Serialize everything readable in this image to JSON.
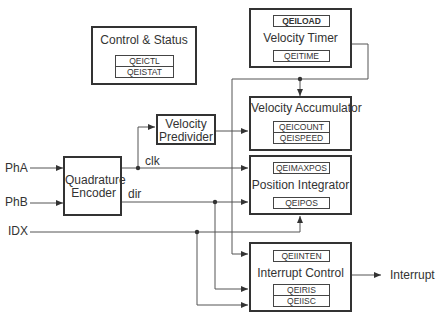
{
  "diagram": {
    "blocks": {
      "control_status": {
        "title": "Control & Status",
        "registers": [
          "QEICTL",
          "QEISTAT"
        ]
      },
      "velocity_timer": {
        "title": "Velocity Timer",
        "registers": [
          "QEILOAD",
          "QEITIME"
        ]
      },
      "velocity_predivider": {
        "title_line1": "Velocity",
        "title_line2": "Predivider"
      },
      "velocity_accumulator": {
        "title": "Velocity Accumulator",
        "registers": [
          "QEICOUNT",
          "QEISPEED"
        ]
      },
      "quadrature_encoder": {
        "title_line1": "Quadrature",
        "title_line2": "Encoder"
      },
      "position_integrator": {
        "title": "Position Integrator",
        "registers": [
          "QEIMAXPOS",
          "QEIPOS"
        ]
      },
      "interrupt_control": {
        "title": "Interrupt Control",
        "registers": [
          "QEIINTEN",
          "QEIRIS",
          "QEIISC"
        ]
      }
    },
    "inputs": [
      "PhA",
      "PhB",
      "IDX"
    ],
    "signals": {
      "clk": "clk",
      "dir": "dir"
    },
    "outputs": [
      "Interrupt"
    ],
    "colors": {
      "line": "#444444",
      "text": "#333333",
      "background": "#ffffff"
    }
  }
}
